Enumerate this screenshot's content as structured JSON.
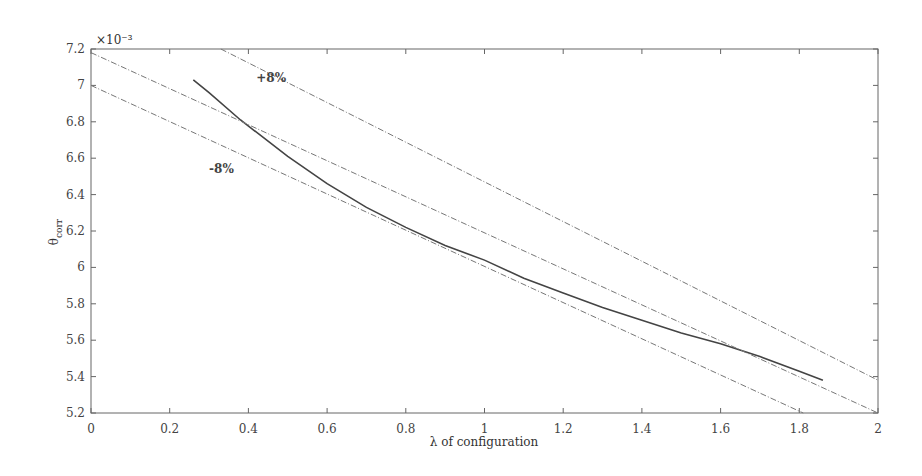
{
  "chart_data": {
    "type": "line",
    "title": "",
    "xlabel": "λ of configuration",
    "ylabel": "θcorr",
    "ylabel_main": "θ",
    "ylabel_sub": "corr",
    "y_multiplier": "×10⁻³",
    "xlim": [
      0,
      2
    ],
    "ylim": [
      5.2,
      7.2
    ],
    "grid": false,
    "legend": "none",
    "x_ticks": [
      "0",
      "0.2",
      "0.4",
      "0.6",
      "0.8",
      "1",
      "1.2",
      "1.4",
      "1.6",
      "1.8",
      "2"
    ],
    "y_ticks": [
      "5.2",
      "5.4",
      "5.6",
      "5.8",
      "6",
      "6.2",
      "6.4",
      "6.6",
      "6.8",
      "7",
      "7.2"
    ],
    "annotations": [
      {
        "text": "+8%",
        "x": 0.42,
        "y": 7.02
      },
      {
        "text": "-8%",
        "x": 0.3,
        "y": 6.52
      }
    ],
    "series": [
      {
        "name": "θcorr curve",
        "style": "solid",
        "x": [
          0.26,
          0.3,
          0.38,
          0.5,
          0.6,
          0.7,
          0.8,
          0.9,
          1.0,
          1.1,
          1.2,
          1.3,
          1.4,
          1.5,
          1.6,
          1.7,
          1.8,
          1.86
        ],
        "y": [
          7.03,
          6.96,
          6.81,
          6.61,
          6.46,
          6.33,
          6.22,
          6.12,
          6.04,
          5.94,
          5.86,
          5.78,
          5.71,
          5.64,
          5.58,
          5.51,
          5.43,
          5.38
        ]
      },
      {
        "name": "reference line",
        "style": "dashed",
        "x": [
          0,
          2
        ],
        "y": [
          7.18,
          5.2
        ]
      },
      {
        "name": "+8%",
        "style": "dashed",
        "x": [
          0.33,
          2
        ],
        "y": [
          7.2,
          5.38
        ]
      },
      {
        "name": "-8%",
        "style": "dashed",
        "x": [
          0,
          1.81
        ],
        "y": [
          7.0,
          5.2
        ]
      }
    ]
  }
}
